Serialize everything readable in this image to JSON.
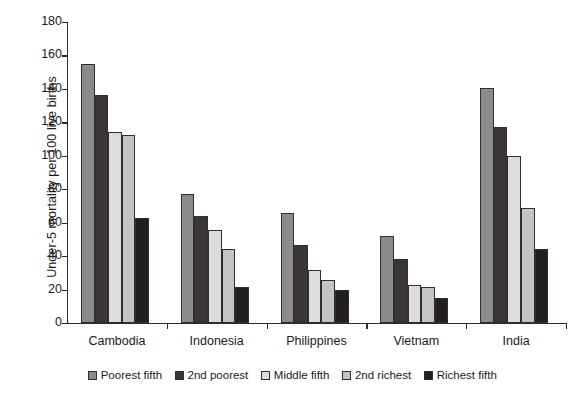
{
  "chart_data": {
    "type": "bar",
    "title": "",
    "xlabel": "",
    "ylabel": "Under-5 mortality per 100 live births",
    "ylim": [
      0,
      180
    ],
    "yticks": [
      0,
      20,
      40,
      60,
      80,
      100,
      120,
      140,
      160,
      180
    ],
    "grid": false,
    "legend_position": "bottom",
    "categories": [
      "Cambodia",
      "Indonesia",
      "Philippines",
      "Vietnam",
      "India"
    ],
    "series": [
      {
        "name": "Poorest fifth",
        "color": "#8b8b8b",
        "values": [
          155,
          77,
          66,
          52,
          140.5
        ]
      },
      {
        "name": "2nd poorest",
        "color": "#3b3535",
        "values": [
          136.5,
          64,
          46.5,
          38,
          117
        ]
      },
      {
        "name": "Middle fifth",
        "color": "#dcdcdc",
        "values": [
          114.5,
          55.5,
          31.5,
          23,
          100
        ]
      },
      {
        "name": "2nd richest",
        "color": "#c4c4c4",
        "values": [
          112.5,
          44.5,
          26,
          21.5,
          69
        ]
      },
      {
        "name": "Richest fifth",
        "color": "#241f1f",
        "values": [
          63,
          21.5,
          20,
          15,
          44.5
        ]
      }
    ]
  },
  "legend": {
    "items": [
      {
        "label": "Poorest fifth"
      },
      {
        "label": "2nd poorest"
      },
      {
        "label": "Middle fifth"
      },
      {
        "label": "2nd richest"
      },
      {
        "label": "Richest fifth"
      }
    ]
  }
}
